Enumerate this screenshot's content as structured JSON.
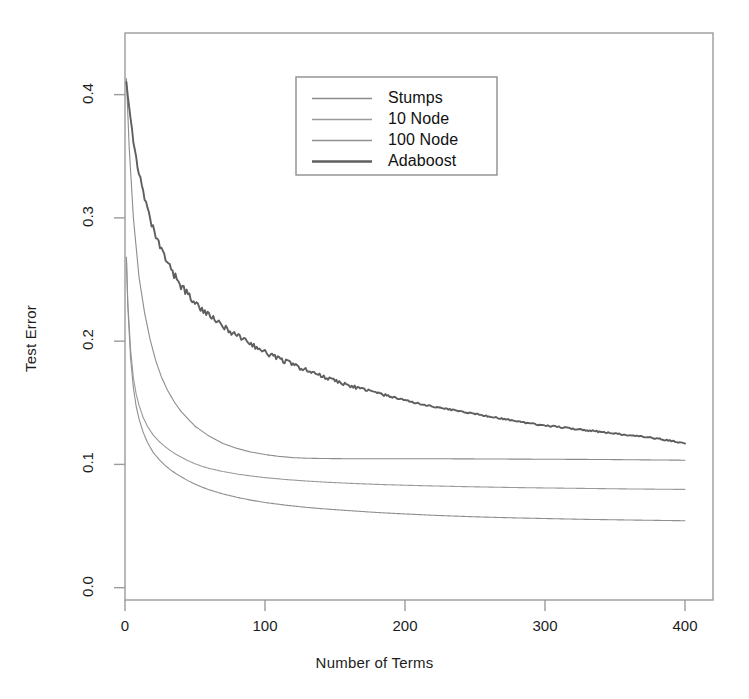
{
  "chart_data": {
    "type": "line",
    "title": "",
    "xlabel": "Number of Terms",
    "ylabel": "Test Error",
    "xlim": [
      0,
      420
    ],
    "ylim": [
      -0.01,
      0.45
    ],
    "xticks": [
      0,
      100,
      200,
      300,
      400
    ],
    "xtick_labels": [
      "0",
      "100",
      "200",
      "300",
      "400"
    ],
    "yticks": [
      0.0,
      0.1,
      0.2,
      0.3,
      0.4
    ],
    "ytick_labels": [
      "0.0",
      "0.1",
      "0.2",
      "0.3",
      "0.4"
    ],
    "grid": false,
    "legend_position": "top-center",
    "frame": {
      "left": 125,
      "right": 713,
      "top": 33,
      "bottom": 600
    },
    "legend_box": {
      "left": 296,
      "top": 77,
      "right": 497,
      "bottom": 175
    },
    "series": [
      {
        "name": "Stumps",
        "color": "#8c8c8c",
        "width": 1.1,
        "x": [
          1,
          3,
          6,
          10,
          14,
          18,
          22,
          26,
          30,
          35,
          40,
          45,
          50,
          55,
          60,
          65,
          70,
          80,
          90,
          100,
          110,
          120,
          130,
          140,
          150,
          160,
          175,
          190,
          205,
          220,
          240,
          260,
          280,
          300,
          320,
          340,
          360,
          380,
          400
        ],
        "y": [
          0.413,
          0.357,
          0.3,
          0.252,
          0.223,
          0.201,
          0.184,
          0.171,
          0.161,
          0.151,
          0.143,
          0.137,
          0.131,
          0.127,
          0.123,
          0.12,
          0.117,
          0.113,
          0.11,
          0.108,
          0.1065,
          0.1055,
          0.105,
          0.1048,
          0.1047,
          0.1046,
          0.1046,
          0.1046,
          0.1046,
          0.1046,
          0.1045,
          0.1044,
          0.1043,
          0.1042,
          0.1041,
          0.104,
          0.1038,
          0.1036,
          0.1034
        ]
      },
      {
        "name": "10 Node",
        "color": "#9a9a9a",
        "width": 1.1,
        "x": [
          1,
          2,
          4,
          6,
          8,
          10,
          13,
          16,
          20,
          24,
          28,
          32,
          36,
          40,
          45,
          50,
          55,
          60,
          70,
          80,
          90,
          100,
          115,
          130,
          145,
          160,
          180,
          200,
          225,
          250,
          275,
          300,
          330,
          360,
          400
        ],
        "y": [
          0.268,
          0.232,
          0.193,
          0.17,
          0.157,
          0.148,
          0.138,
          0.131,
          0.124,
          0.119,
          0.115,
          0.1115,
          0.1085,
          0.106,
          0.103,
          0.1005,
          0.0985,
          0.0968,
          0.0942,
          0.0922,
          0.0906,
          0.0893,
          0.0877,
          0.0865,
          0.0855,
          0.0847,
          0.0838,
          0.0831,
          0.0824,
          0.0818,
          0.0813,
          0.0809,
          0.0805,
          0.0801,
          0.0797
        ]
      },
      {
        "name": "100 Node",
        "color": "#8f8f8f",
        "width": 1.1,
        "x": [
          1,
          2,
          4,
          6,
          8,
          10,
          13,
          16,
          20,
          24,
          28,
          32,
          36,
          40,
          45,
          50,
          55,
          60,
          70,
          80,
          90,
          100,
          115,
          130,
          145,
          160,
          180,
          200,
          225,
          250,
          275,
          300,
          330,
          360,
          400
        ],
        "y": [
          0.268,
          0.228,
          0.186,
          0.162,
          0.147,
          0.137,
          0.126,
          0.118,
          0.11,
          0.1045,
          0.0998,
          0.096,
          0.0928,
          0.09,
          0.0868,
          0.084,
          0.0816,
          0.0795,
          0.076,
          0.0733,
          0.071,
          0.0691,
          0.0669,
          0.0651,
          0.0637,
          0.0625,
          0.061,
          0.0598,
          0.0585,
          0.0575,
          0.0567,
          0.0561,
          0.0554,
          0.0549,
          0.0543
        ]
      },
      {
        "name": "Adaboost",
        "color": "#5f5f5f",
        "width": 1.9,
        "noise": 0.0035,
        "x": [
          1,
          3,
          5,
          8,
          11,
          14,
          17,
          20,
          24,
          28,
          32,
          36,
          40,
          45,
          50,
          55,
          60,
          65,
          70,
          75,
          80,
          85,
          90,
          95,
          100,
          110,
          120,
          130,
          140,
          150,
          160,
          170,
          180,
          190,
          200,
          215,
          230,
          245,
          260,
          275,
          290,
          305,
          320,
          335,
          350,
          365,
          380,
          400
        ],
        "y": [
          0.412,
          0.392,
          0.372,
          0.348,
          0.33,
          0.315,
          0.302,
          0.291,
          0.279,
          0.269,
          0.26,
          0.252,
          0.245,
          0.238,
          0.231,
          0.226,
          0.221,
          0.216,
          0.212,
          0.208,
          0.205,
          0.201,
          0.198,
          0.194,
          0.191,
          0.186,
          0.181,
          0.176,
          0.172,
          0.168,
          0.164,
          0.161,
          0.158,
          0.155,
          0.152,
          0.148,
          0.145,
          0.142,
          0.139,
          0.136,
          0.133,
          0.131,
          0.129,
          0.127,
          0.125,
          0.123,
          0.121,
          0.117
        ]
      }
    ],
    "legend_entries": [
      {
        "label": "Stumps",
        "color": "#8c8c8c",
        "width": 1.3
      },
      {
        "label": "10 Node",
        "color": "#9a9a9a",
        "width": 1.3
      },
      {
        "label": "100 Node",
        "color": "#8f8f8f",
        "width": 1.3
      },
      {
        "label": "Adaboost",
        "color": "#5f5f5f",
        "width": 2.4
      }
    ]
  }
}
